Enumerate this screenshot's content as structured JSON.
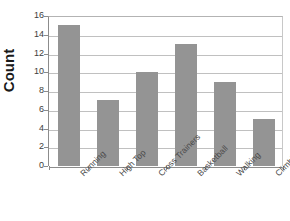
{
  "chart_data": {
    "type": "bar",
    "title": "",
    "xlabel": "",
    "ylabel": "Count",
    "categories": [
      "Running",
      "High Top",
      "Cross Trainers",
      "Basketball",
      "Walking",
      "Climbing"
    ],
    "values": [
      15,
      7,
      10,
      13,
      9,
      5
    ],
    "ylim": [
      0,
      16
    ],
    "y_ticks": [
      0,
      2,
      4,
      6,
      8,
      10,
      12,
      14,
      16
    ],
    "y_tick_labels": [
      "0",
      "2",
      "4",
      "6",
      "8",
      "10",
      "12",
      "14",
      "16"
    ],
    "grid": true,
    "legend": false,
    "bar_color": "#949494",
    "gridline_color": "#c0c0c0",
    "axis_color": "#8c8c8c",
    "label_rotation_degrees": -45,
    "background_color": "#ffffff"
  }
}
